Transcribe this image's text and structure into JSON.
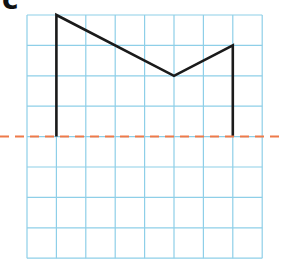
{
  "figure": {
    "label": "c",
    "grid": {
      "columns": 8,
      "rows": 8,
      "origin_px": [
        27,
        15
      ],
      "cell_w_px": 29.4,
      "cell_h_px": 30.4,
      "line_color": "#8ecfe8"
    },
    "shape": {
      "stroke_color": "#1a1a1a",
      "points_grid": [
        [
          1,
          4
        ],
        [
          1,
          0
        ],
        [
          5,
          2
        ],
        [
          7,
          1
        ],
        [
          7,
          4
        ]
      ]
    },
    "mirror_line": {
      "row": 4,
      "color": "#ee7a4a",
      "style": "dashed",
      "x_start_px": 0,
      "x_end_px": 280
    }
  }
}
